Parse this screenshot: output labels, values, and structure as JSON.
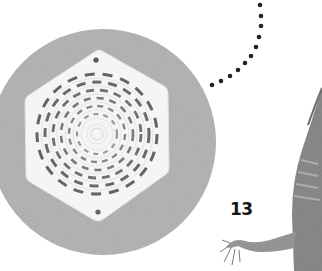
{
  "page": {
    "number": "13",
    "colors": {
      "background": "#ffffff",
      "sand": "#b6b6b6",
      "vent": "#f4f4f4",
      "slot": "#4a4a4a",
      "dots": "#222222",
      "lizard": "#8a8a8a"
    }
  },
  "illustrations": [
    {
      "name": "vent-cover-on-sand",
      "description": "hexagonal vent cover with concentric slotted rings on circular sand background"
    },
    {
      "name": "dotted-connector",
      "description": "curved dotted line"
    },
    {
      "name": "monitor-lizard",
      "description": "partial lizard with tail and front leg"
    }
  ]
}
